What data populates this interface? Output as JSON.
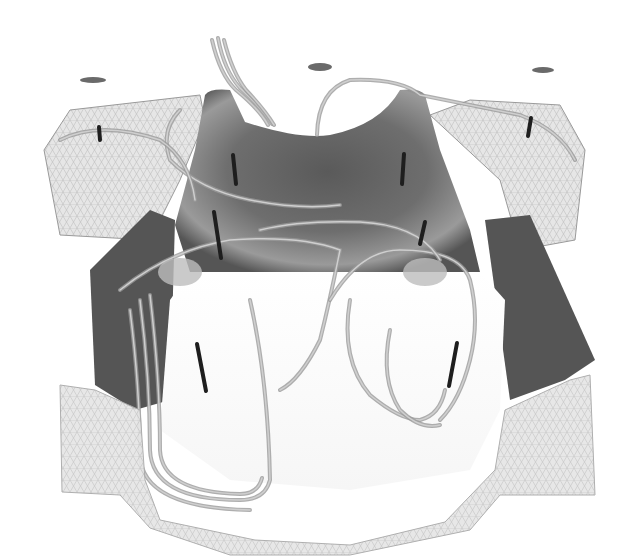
{
  "image": {
    "width": 635,
    "height": 556,
    "background": "#ffffff",
    "description": "Grayscale 3D render of a meshed enclosure with streamline tubes and probe rods; no visible text"
  },
  "colors": {
    "mesh_fill": "#e6e6e6",
    "mesh_line": "#bdbdbd",
    "back_wall_dark": "#4a4a4a",
    "back_wall_mid": "#7a7a7a",
    "back_wall_light": "#b5b5b5",
    "side_panel": "#555555",
    "rod": "#1e1e1e",
    "streamline": "#9a9a9a",
    "streamline_light": "#cfcfcf",
    "disc": "#6a6a6a"
  },
  "geometry": {
    "left_wing": "M44,150 L70,110 L200,95 L205,120 L180,180 L150,240 L60,235 Z",
    "right_wing": "M430,115 L470,100 L560,105 L585,150 L575,240 L520,250 L500,180 Z",
    "back_wall": "M205,95 Q210,88 230,90 L245,122 Q300,140 330,135 Q380,125 400,90 Q420,88 425,95 L440,150 L470,230 L480,272 L190,272 L175,225 L195,150 Z",
    "left_panel": "M90,270 L150,210 L175,220 L170,400 L135,410 L95,385 Z",
    "right_panel": "M485,220 L530,215 L595,360 L565,380 L510,400 Z",
    "front_band": "M60,385 L95,390 L140,410 L145,480 L160,520 L255,540 L350,545 L445,522 L495,470 L505,410 L570,380 L590,375 L595,495 L500,495 L470,530 L350,555 L230,555 L150,528 L120,495 L62,492 Z",
    "inner_floor": "M170,300 L190,272 L480,272 L505,300 L500,410 L470,470 L350,490 L230,480 L160,430 Z",
    "rods": [
      {
        "x1": 99,
        "y1": 127,
        "x2": 100,
        "y2": 140
      },
      {
        "x1": 233,
        "y1": 155,
        "x2": 236,
        "y2": 184
      },
      {
        "x1": 404,
        "y1": 154,
        "x2": 402,
        "y2": 184
      },
      {
        "x1": 531,
        "y1": 118,
        "x2": 528,
        "y2": 136
      },
      {
        "x1": 214,
        "y1": 212,
        "x2": 221,
        "y2": 258
      },
      {
        "x1": 425,
        "y1": 222,
        "x2": 420,
        "y2": 244
      },
      {
        "x1": 197,
        "y1": 344,
        "x2": 206,
        "y2": 391
      },
      {
        "x1": 457,
        "y1": 343,
        "x2": 449,
        "y2": 386
      }
    ],
    "discs": [
      {
        "cx": 93,
        "cy": 80,
        "rx": 13,
        "ry": 3
      },
      {
        "cx": 320,
        "cy": 67,
        "rx": 12,
        "ry": 4
      },
      {
        "cx": 543,
        "cy": 70,
        "rx": 11,
        "ry": 3
      },
      {
        "cx": 180,
        "cy": 272,
        "rx": 22,
        "ry": 14
      },
      {
        "cx": 425,
        "cy": 272,
        "rx": 22,
        "ry": 14
      }
    ],
    "streamlines": [
      "M212,40 Q220,75 236,90 Q260,110 268,125",
      "M218,38 Q224,70 240,88 Q262,108 272,124",
      "M224,40 Q232,72 246,90 Q265,110 274,125",
      "M317,135 Q318,90 350,80 Q400,78 420,95 Q470,105 520,115 Q560,130 575,160",
      "M180,110 Q160,130 170,160 Q200,190 250,200 Q300,210 340,205",
      "M120,290 Q170,250 230,240 Q300,235 340,250 Q330,300 320,340 Q300,380 280,390",
      "M140,300 Q150,380 150,450 Q152,500 240,500 Q265,500 270,480 Q268,380 250,300",
      "M150,295 Q160,380 160,450 Q162,492 240,494 Q258,494 262,478",
      "M130,310 Q140,390 140,455 Q142,508 250,510",
      "M330,300 Q360,250 400,250 Q460,250 470,280 Q480,320 470,360 Q460,400 440,420",
      "M350,300 Q340,360 370,395 Q400,420 420,420 Q440,415 445,390",
      "M390,330 Q380,380 400,410 Q420,430 440,425",
      "M260,230 Q300,220 360,222 Q420,225 440,260",
      "M60,140 Q100,120 160,140 Q190,160 195,200"
    ]
  }
}
